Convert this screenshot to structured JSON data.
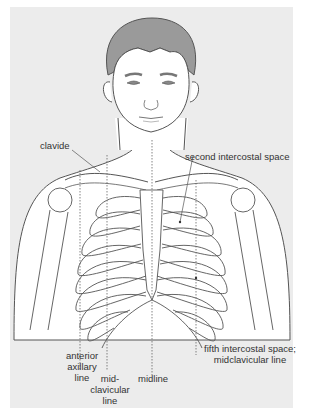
{
  "figure": {
    "colors": {
      "background_panel": "#ececec",
      "hair": "#9a9a9a",
      "skin": "#ffffff",
      "line": "#555555",
      "text": "#333333"
    },
    "labels": {
      "clavicle": "clavide",
      "second_intercostal": "second intercostal space",
      "anterior_axillary_1": "anterior",
      "anterior_axillary_2": "axillary",
      "anterior_axillary_3": "line",
      "midclavicular_1": "mid-",
      "midclavicular_2": "clavicular",
      "midclavicular_3": "line",
      "midline": "midline",
      "fifth_intercostal_1": "fifth intercostal space;",
      "fifth_intercostal_2": "midclavicular line"
    }
  }
}
